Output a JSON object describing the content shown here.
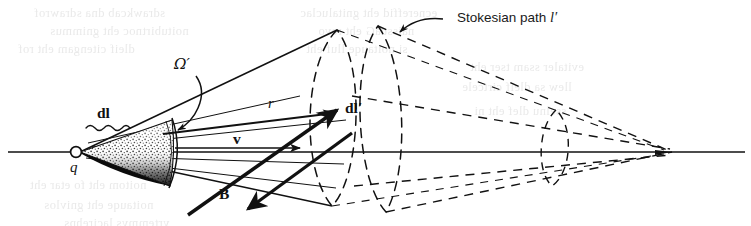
{
  "figure": {
    "kind": "physics-vector-diagram",
    "caption_visible": false,
    "background_color": "#ffffff",
    "ink_color": "#111111",
    "width": 751,
    "height": 226
  },
  "labels": {
    "dl": "dl",
    "dl_prime": "dl′",
    "charge": "q",
    "solid_angle": "Ω′",
    "radius": "r",
    "velocity": "v",
    "magnetic_field": "B",
    "stokesian_path": "Stokesian path ",
    "stokesian_path_symbol": "l′"
  },
  "elements": {
    "axis": {
      "name": "horizontal-axis",
      "from_x": 8,
      "to_x": 745,
      "y": 152
    },
    "charge_marker": {
      "name": "charge-circle",
      "cx": 76,
      "cy": 152,
      "r": 5.4
    },
    "cone": {
      "name": "stippled-cone",
      "apex_x": 80,
      "apex_y": 152,
      "cap_x": 172
    },
    "ellipse_near": {
      "cx": 335,
      "cy": 118,
      "rx": 29,
      "ry": 88
    },
    "ellipse_far": {
      "cx": 396,
      "cy": 120,
      "rx": 26,
      "ry": 90
    },
    "ellipse_small": {
      "cx": 556,
      "cy": 148,
      "rx": 16,
      "ry": 40
    },
    "convergence_point": {
      "x": 672,
      "y": 152
    }
  },
  "ghost_text": [
    {
      "text": "sdrawkcab dna sdrawrof",
      "x": 34,
      "y": 6
    },
    {
      "text": "ecnereffid eht gnitaluclac",
      "x": 300,
      "y": 6
    },
    {
      "text": "noitubirtnoc eht gnimmus",
      "x": 50,
      "y": 24
    },
    {
      "text": "naissuaG eht revo",
      "x": 318,
      "y": 24
    },
    {
      "text": "dleif citengam eht rof",
      "x": 18,
      "y": 42
    },
    {
      "text": "si noitauqe lluf eht",
      "x": 306,
      "y": 42
    },
    {
      "text": "evitaler ssam tser eht",
      "x": 470,
      "y": 60
    },
    {
      "text": "llew sa dleif cirtcele",
      "x": 462,
      "y": 80
    },
    {
      "text": "sselnu dlef eht ni",
      "x": 474,
      "y": 104
    },
    {
      "text": "noitom eht fo etar eht",
      "x": 30,
      "y": 178
    },
    {
      "text": "noitauqe eht gnivlos",
      "x": 44,
      "y": 198
    },
    {
      "text": "yrtemmys lacirehps",
      "x": 64,
      "y": 216
    }
  ]
}
